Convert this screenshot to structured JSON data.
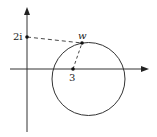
{
  "diagram": {
    "type": "complex-plane",
    "labels": {
      "imag_point": "2i",
      "real_point": "3",
      "moving_point": "w"
    },
    "colors": {
      "stroke": "#333333",
      "background": "#ffffff"
    },
    "elements": [
      {
        "kind": "axis",
        "name": "real-axis",
        "arrow": "right"
      },
      {
        "kind": "axis",
        "name": "imaginary-axis",
        "arrow": "up"
      },
      {
        "kind": "point",
        "name": "2i",
        "on": "imaginary-axis"
      },
      {
        "kind": "point",
        "name": "3",
        "on": "real-axis"
      },
      {
        "kind": "circle",
        "name": "locus-circle"
      },
      {
        "kind": "point",
        "name": "w",
        "on": "locus-circle"
      },
      {
        "kind": "dashed-segment",
        "from": "2i",
        "to": "w"
      },
      {
        "kind": "dashed-segment",
        "from": "3",
        "to": "w"
      }
    ]
  }
}
